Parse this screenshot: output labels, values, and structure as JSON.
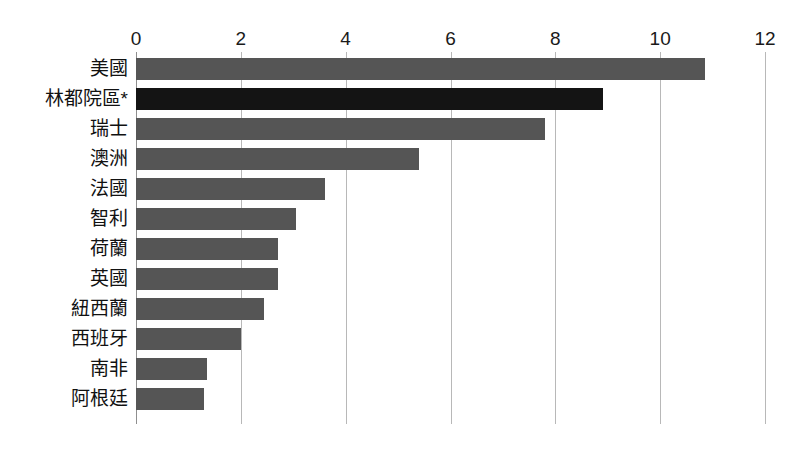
{
  "chart_data": {
    "type": "bar",
    "orientation": "horizontal",
    "title": "",
    "subtitle": "",
    "xlabel": "",
    "ylabel": "",
    "xlim": [
      0,
      12
    ],
    "xticks": [
      "0",
      "2",
      "4",
      "6",
      "8",
      "10",
      "12"
    ],
    "xtick_values": [
      0,
      2,
      4,
      6,
      8,
      10,
      12
    ],
    "grid": "vertical",
    "legend": "none",
    "categories": [
      "美國",
      "林都院區*",
      "瑞士",
      "澳洲",
      "法國",
      "智利",
      "荷蘭",
      "英國",
      "紐西蘭",
      "西班牙",
      "南非",
      "阿根廷"
    ],
    "values": [
      10.85,
      8.9,
      7.8,
      5.4,
      3.6,
      3.05,
      2.7,
      2.7,
      2.45,
      2.0,
      1.35,
      1.3
    ],
    "series": [
      {
        "name": "",
        "values": [
          10.85,
          8.9,
          7.8,
          5.4,
          3.6,
          3.05,
          2.7,
          2.7,
          2.45,
          2.0,
          1.35,
          1.3
        ]
      }
    ],
    "highlight_index": 1,
    "colors": {
      "bar": "#555555",
      "bar_highlight": "#141414",
      "gridline": "#b8b8b8",
      "axis": "#8f8f8f",
      "text": "#111111",
      "background": "#ffffff"
    },
    "annotations": []
  }
}
